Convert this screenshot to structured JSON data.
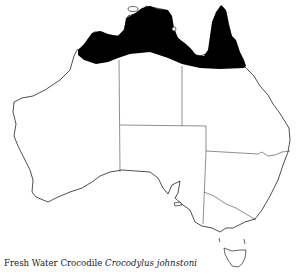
{
  "map": {
    "region": "Australia",
    "subject": "Distribution range",
    "range_fill_color": "#000000",
    "outline_color": "#222222",
    "background_color": "#ffffff",
    "states_shown": [
      "WA",
      "NT",
      "QLD",
      "SA",
      "NSW",
      "VIC",
      "TAS"
    ]
  },
  "caption": {
    "common_name": "Fresh Water Crocodile",
    "scientific_name": "Crocodylus johnstoni"
  }
}
